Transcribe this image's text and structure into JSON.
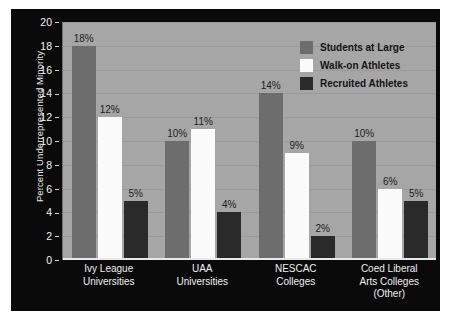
{
  "chart_data": {
    "type": "bar",
    "title": "",
    "xlabel": "",
    "ylabel": "Percent Underrepresented Minority",
    "ylim": [
      0,
      20
    ],
    "y_ticks": [
      0,
      2,
      4,
      6,
      8,
      10,
      12,
      14,
      16,
      18,
      20
    ],
    "grid": true,
    "legend_position": "top-right",
    "categories": [
      "Ivy League Universities",
      "UAA Universities",
      "NESCAC Colleges",
      "Coed Liberal Arts Colleges (Other)"
    ],
    "category_lines": [
      [
        "Ivy League",
        "Universities"
      ],
      [
        "UAA",
        "Universities"
      ],
      [
        "NESCAC",
        "Colleges"
      ],
      [
        "Coed Liberal",
        "Arts Colleges",
        "(Other)"
      ]
    ],
    "series": [
      {
        "name": "Students at Large",
        "key": "students",
        "color": "#6d6d6d",
        "values": [
          18,
          10,
          14,
          10
        ],
        "labels": [
          "18%",
          "10%",
          "14%",
          "10%"
        ]
      },
      {
        "name": "Walk-on Athletes",
        "key": "walkon",
        "color": "#fbfbfb",
        "values": [
          12,
          11,
          9,
          6
        ],
        "labels": [
          "12%",
          "11%",
          "9%",
          "6%"
        ]
      },
      {
        "name": "Recruited Athletes",
        "key": "recruited",
        "color": "#2a2a2a",
        "values": [
          5,
          4,
          2,
          5
        ],
        "labels": [
          "5%",
          "4%",
          "2%",
          "5%"
        ]
      }
    ]
  },
  "colors": {
    "panel_background": "#0a0a0a",
    "plot_background": "#a6a6a6",
    "gridline": "#9a9a9a",
    "axis_text": "#f2f2f2",
    "data_label_text": "#1d1d1d",
    "legend_text": "#141414"
  }
}
